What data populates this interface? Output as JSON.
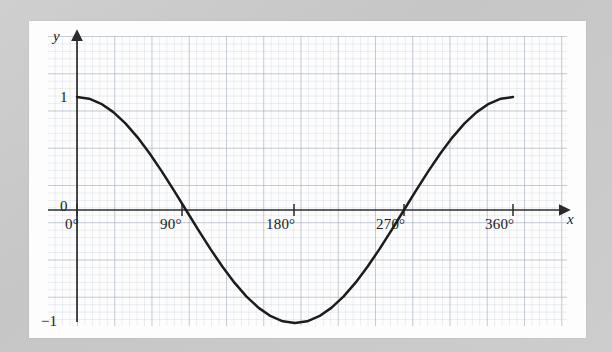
{
  "figure": {
    "kind": "graph-paper-plot",
    "paper_color": "#fdfdfd",
    "background_color": "#c9c9c9",
    "grid_minor_color": "#b9c4cf",
    "grid_major_color": "#8e9aa6",
    "curve_color": "#1c1c1c",
    "axis_color": "#2b2b2b"
  },
  "axes": {
    "x_name": "x",
    "y_name": "y",
    "x_tick_labels": [
      "0°",
      "90°",
      "180°",
      "270°",
      "360°"
    ],
    "x_tick_values": [
      0,
      90,
      180,
      270,
      360
    ],
    "y_tick_labels": [
      "1",
      "0",
      "−1"
    ],
    "y_tick_values": [
      1,
      0,
      -1
    ]
  },
  "chart_data": {
    "type": "line",
    "title": "",
    "subtitle": "",
    "xlabel": "x",
    "ylabel": "y",
    "xlim": [
      -15,
      395
    ],
    "ylim": [
      -1.35,
      1.35
    ],
    "grid": true,
    "grid_minor_step_x": 6,
    "grid_minor_step_y": 0.0667,
    "grid_major_step_x": 30,
    "grid_major_step_y": 0.3333,
    "legend": null,
    "annotations": [],
    "series": [
      {
        "name": "y = cos x",
        "equation": "y = cos(x)",
        "x": [
          0,
          10,
          20,
          30,
          40,
          50,
          60,
          70,
          80,
          90,
          100,
          110,
          120,
          130,
          140,
          150,
          160,
          170,
          180,
          190,
          200,
          210,
          220,
          230,
          240,
          250,
          260,
          270,
          280,
          290,
          300,
          310,
          320,
          330,
          340,
          350,
          360
        ],
        "values": [
          1.0,
          0.985,
          0.94,
          0.866,
          0.766,
          0.643,
          0.5,
          0.342,
          0.174,
          0.0,
          -0.174,
          -0.342,
          -0.5,
          -0.643,
          -0.766,
          -0.866,
          -0.94,
          -0.985,
          -1.0,
          -0.985,
          -0.94,
          -0.866,
          -0.766,
          -0.643,
          -0.5,
          -0.342,
          -0.174,
          0.0,
          0.174,
          0.342,
          0.5,
          0.643,
          0.766,
          0.866,
          0.94,
          0.985,
          1.0
        ]
      }
    ],
    "key_points": [
      {
        "x": 0,
        "y": 1,
        "note": "maximum"
      },
      {
        "x": 90,
        "y": 0,
        "note": "zero crossing"
      },
      {
        "x": 180,
        "y": -1,
        "note": "minimum"
      },
      {
        "x": 270,
        "y": 0,
        "note": "zero crossing"
      },
      {
        "x": 360,
        "y": 1,
        "note": "maximum"
      }
    ]
  }
}
